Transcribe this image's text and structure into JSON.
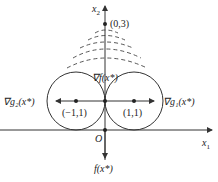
{
  "diagram": {
    "axes": {
      "x_label": "x",
      "x_sub": "1",
      "y_label": "x",
      "y_sub": "2",
      "origin_label": "O"
    },
    "points": [
      {
        "label": "(0,3)"
      },
      {
        "label": "(-1,1)",
        "display": "(−1,1)"
      },
      {
        "label": "(1,1)"
      }
    ],
    "vectors": {
      "grad_f": "∇f(x*)",
      "grad_g1": "∇g₁(x*)",
      "grad_g2": "∇g₂(x*)",
      "f": "f(x*)"
    },
    "colors": {
      "line": "#333333",
      "background": "#ffffff"
    }
  }
}
